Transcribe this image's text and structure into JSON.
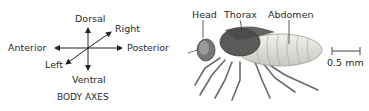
{
  "axes": {
    "dorsal": "Dorsal",
    "right": "Right",
    "anterior": "Anterior",
    "posterior": "Posterior",
    "left": "Left",
    "ventral": "Ventral",
    "caption": "BODY AXES"
  },
  "fly": {
    "head": "Head",
    "thorax": "Thorax",
    "abdomen": "Abdomen"
  },
  "scale_bar": {
    "label": "0.5 mm"
  }
}
